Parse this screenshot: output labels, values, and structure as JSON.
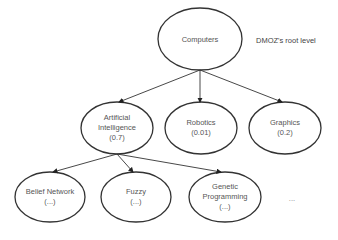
{
  "diagram": {
    "root": {
      "label": "Computers",
      "note": "DMOZ's root level"
    },
    "level1": [
      {
        "line1": "Artificial",
        "line2": "Intelligence",
        "line3": "(0.7)"
      },
      {
        "line1": "Robotics",
        "line2": "(0.01)"
      },
      {
        "line1": "Graphics",
        "line2": "(0.2)"
      }
    ],
    "level2": [
      {
        "line1": "Belief Network",
        "line2": "(...)"
      },
      {
        "line1": "Fuzzy",
        "line2": "(...)"
      },
      {
        "line1": "Genetic",
        "line2": "Programming",
        "line3": "(...)"
      }
    ],
    "more": "..."
  }
}
